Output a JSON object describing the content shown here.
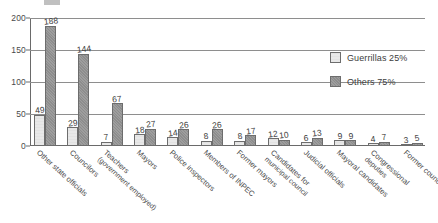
{
  "chart_data": {
    "type": "bar",
    "title": "",
    "subtitle": "",
    "xlabel": "",
    "ylabel": "",
    "ylim": [
      0,
      200
    ],
    "yticks": [
      0,
      50,
      100,
      150,
      200
    ],
    "grid": true,
    "legend_position": "right",
    "categories": [
      "Other state officials",
      "Councilors",
      "Teachers (government employed)",
      "Mayors",
      "Police inspectors",
      "Members of INPEC",
      "Former mayors",
      "Candidates for municipal council",
      "Judicial officials",
      "Mayoral candidates",
      "Congressional deputies",
      "Former councilors"
    ],
    "category_lines": [
      [
        "Other state officials"
      ],
      [
        "Councilors"
      ],
      [
        "Teachers",
        "(government employed)"
      ],
      [
        "Mayors"
      ],
      [
        "Police inspectors"
      ],
      [
        "Members of INPEC"
      ],
      [
        "Former mayors"
      ],
      [
        "Candidates for",
        "municipal council"
      ],
      [
        "Judicial officials"
      ],
      [
        "Mayoral candidates"
      ],
      [
        "Congressional",
        "deputies"
      ],
      [
        "Former councilors"
      ]
    ],
    "series": [
      {
        "name": "Guerrillas 25%",
        "color": "#e6e6e6",
        "values": [
          49,
          29,
          7,
          18,
          14,
          8,
          8,
          12,
          6,
          9,
          4,
          3
        ]
      },
      {
        "name": "Others 75%",
        "color": "#959595",
        "values": [
          188,
          144,
          67,
          27,
          26,
          26,
          17,
          10,
          13,
          9,
          7,
          5
        ]
      }
    ]
  },
  "legend": {
    "items": [
      {
        "label": "Guerrillas 25%",
        "swatch": "light-gray"
      },
      {
        "label": "Others 75%",
        "swatch": "dark-gray"
      }
    ]
  }
}
